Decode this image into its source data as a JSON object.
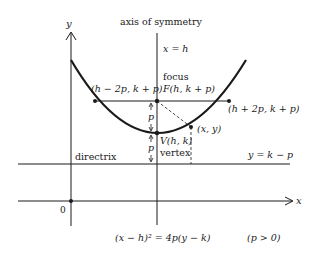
{
  "diagram": {
    "type": "parabola-geometry",
    "equation": "(x − h)² = 4p(y − k)",
    "condition": "(p > 0)",
    "labels": {
      "y_axis": "y",
      "x_axis": "x",
      "origin": "0",
      "axis_of_symmetry": "axis of symmetry",
      "axis_eq": "x = h",
      "focus_word": "focus",
      "focus_point": "F(h, k + p)",
      "left_point": "(h − 2p, k + p)",
      "right_point": "(h + 2p, k + p)",
      "general_point": "(x, y)",
      "vertex_point": "V(h, k)",
      "vertex_word": "vertex",
      "directrix_word": "directrix",
      "directrix_eq": "y = k − p",
      "p_upper": "p",
      "p_lower": "p"
    },
    "colors": {
      "ink": "#1a1a1a",
      "background": "#ffffff"
    }
  }
}
